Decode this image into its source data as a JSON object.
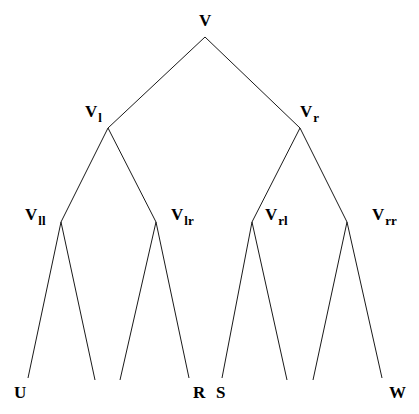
{
  "diagram": {
    "type": "binary-tree",
    "root": {
      "id": "v",
      "label": "V",
      "subscript": "",
      "x": 205,
      "y": 37
    },
    "internal_nodes": [
      {
        "id": "vl",
        "label": "V",
        "subscript": "l",
        "x": 108,
        "y": 128,
        "parent": "v"
      },
      {
        "id": "vr",
        "label": "V",
        "subscript": "r",
        "x": 300,
        "y": 128,
        "parent": "v"
      },
      {
        "id": "vll",
        "label": "V",
        "subscript": "ll",
        "x": 61,
        "y": 222,
        "parent": "vl"
      },
      {
        "id": "vlr",
        "label": "V",
        "subscript": "lr",
        "x": 156,
        "y": 222,
        "parent": "vl"
      },
      {
        "id": "vrl",
        "label": "V",
        "subscript": "rl",
        "x": 252,
        "y": 222,
        "parent": "vr"
      },
      {
        "id": "vrr",
        "label": "V",
        "subscript": "rr",
        "x": 347,
        "y": 222,
        "parent": "vr"
      }
    ],
    "leaves": [
      {
        "label": "U",
        "x": 28,
        "y": 378,
        "parent": "vll"
      },
      {
        "label": "",
        "x": 95,
        "y": 380,
        "parent": "vll"
      },
      {
        "label": "",
        "x": 120,
        "y": 380,
        "parent": "vlr"
      },
      {
        "label": "R",
        "x": 189,
        "y": 378,
        "parent": "vlr"
      },
      {
        "label": "S",
        "x": 222,
        "y": 378,
        "parent": "vrl"
      },
      {
        "label": "",
        "x": 287,
        "y": 380,
        "parent": "vrl"
      },
      {
        "label": "",
        "x": 313,
        "y": 380,
        "parent": "vrr"
      },
      {
        "label": "W",
        "x": 382,
        "y": 378,
        "parent": "vrr"
      }
    ],
    "colors": {
      "edge": "#1a1a1a",
      "text": "#000000",
      "background": "#ffffff"
    }
  }
}
